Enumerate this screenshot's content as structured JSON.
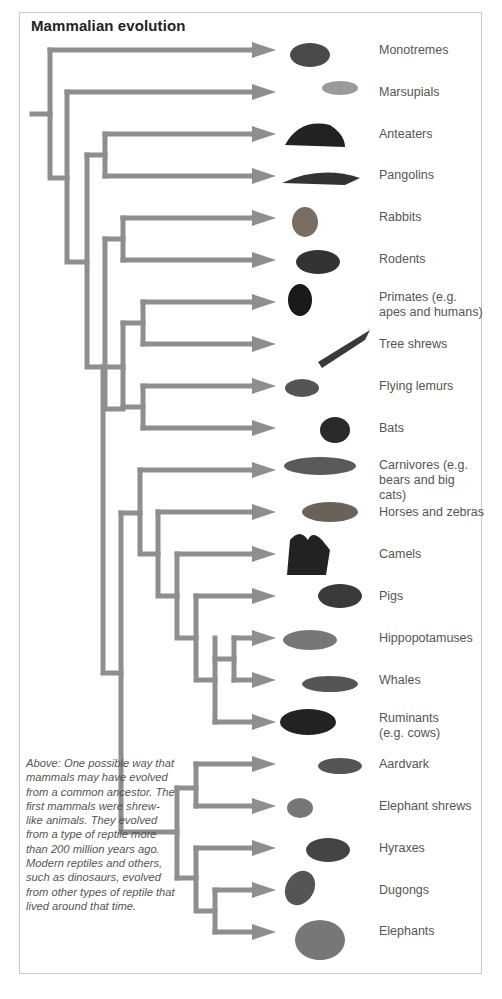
{
  "title": "Mammalian evolution",
  "colors": {
    "branch": "#8e8e8e",
    "label": "#555555",
    "frame": "#c9c9c9"
  },
  "leaves": [
    {
      "label": "Monotremes",
      "y": 50,
      "icon": "platypus-icon"
    },
    {
      "label": "Marsupials",
      "y": 92,
      "icon": "sugar-glider-icon"
    },
    {
      "label": "Anteaters",
      "y": 134,
      "icon": "anteater-icon"
    },
    {
      "label": "Pangolins",
      "y": 176,
      "icon": "pangolin-icon"
    },
    {
      "label": "Rabbits",
      "y": 218,
      "icon": "rabbit-icon"
    },
    {
      "label": "Rodents",
      "y": 260,
      "icon": "rodent-icon"
    },
    {
      "label": "Primates (e.g. apes and humans)",
      "y": 302,
      "icon": "chimpanzee-icon"
    },
    {
      "label": "Tree shrews",
      "y": 344,
      "icon": "tree-shrew-icon"
    },
    {
      "label": "Flying lemurs",
      "y": 386,
      "icon": "flying-lemur-icon"
    },
    {
      "label": "Bats",
      "y": 428,
      "icon": "bat-icon"
    },
    {
      "label": "Carnivores (e.g. bears and big cats)",
      "y": 470,
      "icon": "cheetah-icon"
    },
    {
      "label": "Horses and zebras",
      "y": 512,
      "icon": "horse-icon"
    },
    {
      "label": "Camels",
      "y": 554,
      "icon": "camel-icon"
    },
    {
      "label": "Pigs",
      "y": 596,
      "icon": "boar-icon"
    },
    {
      "label": "Hippopotamuses",
      "y": 638,
      "icon": "hippopotamus-icon"
    },
    {
      "label": "Whales",
      "y": 680,
      "icon": "whale-icon"
    },
    {
      "label": "Ruminants (e.g. cows)",
      "y": 722,
      "icon": "buffalo-icon"
    },
    {
      "label": "Aardvark",
      "y": 764,
      "icon": "aardvark-icon"
    },
    {
      "label": "Elephant shrews",
      "y": 806,
      "icon": "elephant-shrew-icon"
    },
    {
      "label": "Hyraxes",
      "y": 848,
      "icon": "hyrax-icon"
    },
    {
      "label": "Dugongs",
      "y": 890,
      "icon": "dugong-icon"
    },
    {
      "label": "Elephants",
      "y": 932,
      "icon": "elephant-icon"
    }
  ],
  "caption": "Above: One possible way that mammals may have evolved from a common ancestor. The first mammals were shrew-like animals. They evolved from a type of reptile more than 200 million years ago. Modern reptiles and others, such as dinosaurs, evolved from other types of reptile that lived around that time."
}
